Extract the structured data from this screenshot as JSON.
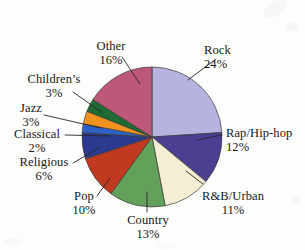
{
  "chart_data": {
    "type": "pie",
    "title": "",
    "xlabel": "",
    "ylabel": "",
    "legend_position": "none",
    "grid": false,
    "labels_show_percent": true,
    "start_angle_deg": 0,
    "direction": "clockwise",
    "categories": [
      "Rock",
      "Rap/Hip-hop",
      "R&B/Urban",
      "Country",
      "Pop",
      "Religious",
      "Classical",
      "Jazz",
      "Children's",
      "Other"
    ],
    "values": [
      24,
      12,
      11,
      13,
      10,
      6,
      2,
      3,
      3,
      16
    ],
    "colors": [
      "#b6b4de",
      "#4b3f92",
      "#f4eed4",
      "#63a05a",
      "#c03a20",
      "#2b3a8f",
      "#2f62c8",
      "#f0921f",
      "#1f6b33",
      "#bd5878"
    ],
    "slices": [
      {
        "label": "Rock",
        "value": 24,
        "percent_text": "24%",
        "color": "#b6b4de"
      },
      {
        "label": "Rap/Hip-hop",
        "value": 12,
        "percent_text": "12%",
        "color": "#4b3f92"
      },
      {
        "label": "R&B/Urban",
        "value": 11,
        "percent_text": "11%",
        "color": "#f4eed4"
      },
      {
        "label": "Country",
        "value": 13,
        "percent_text": "13%",
        "color": "#63a05a"
      },
      {
        "label": "Pop",
        "value": 10,
        "percent_text": "10%",
        "color": "#c03a20"
      },
      {
        "label": "Religious",
        "value": 6,
        "percent_text": "6%",
        "color": "#2b3a8f"
      },
      {
        "label": "Classical",
        "value": 2,
        "percent_text": "2%",
        "color": "#2f62c8"
      },
      {
        "label": "Jazz",
        "value": 3,
        "percent_text": "3%",
        "color": "#f0921f"
      },
      {
        "label": "Children's",
        "value": 3,
        "percent_text": "3%",
        "color": "#1f6b33"
      },
      {
        "label": "Other",
        "value": 16,
        "percent_text": "16%",
        "color": "#bd5878"
      }
    ]
  },
  "labels": {
    "rock": {
      "name": "Rock",
      "pct": "24%"
    },
    "rap": {
      "name": "Rap/Hip-hop",
      "pct": "12%"
    },
    "rnb": {
      "name": "R&B/Urban",
      "pct": "11%"
    },
    "country": {
      "name": "Country",
      "pct": "13%"
    },
    "pop": {
      "name": "Pop",
      "pct": "10%"
    },
    "religious": {
      "name": "Religious",
      "pct": "6%"
    },
    "classical": {
      "name": "Classical",
      "pct": "2%"
    },
    "jazz": {
      "name": "Jazz",
      "pct": "3%"
    },
    "childrens": {
      "name": "Children’s",
      "pct": "3%"
    },
    "other": {
      "name": "Other",
      "pct": "16%"
    }
  }
}
